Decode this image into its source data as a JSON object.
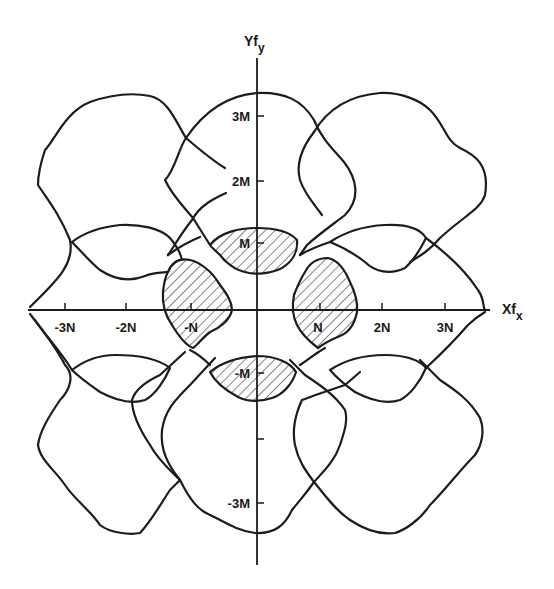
{
  "figure": {
    "type": "aliasing-spectrum-diagram",
    "axes": {
      "x_label": {
        "main": "Xf",
        "sub": "x"
      },
      "y_label": {
        "main": "Yf",
        "sub": "y"
      },
      "x_ticks": [
        {
          "label": "-3N",
          "value": -3
        },
        {
          "label": "-2N",
          "value": -2
        },
        {
          "label": "-N",
          "value": -1
        },
        {
          "label": "N",
          "value": 1
        },
        {
          "label": "2N",
          "value": 2
        },
        {
          "label": "3N",
          "value": 3
        }
      ],
      "y_ticks": [
        {
          "label": "3M",
          "value": 3
        },
        {
          "label": "2M",
          "value": 2
        },
        {
          "label": "M",
          "value": 1
        },
        {
          "label": "-M",
          "value": -1
        },
        {
          "label": "",
          "value": -2
        },
        {
          "label": "-3M",
          "value": -3
        }
      ]
    },
    "hatched_regions": [
      "M",
      "-M",
      "N",
      "-N"
    ],
    "colors": {
      "line": "#1c1c1c",
      "background": "#ffffff"
    }
  }
}
